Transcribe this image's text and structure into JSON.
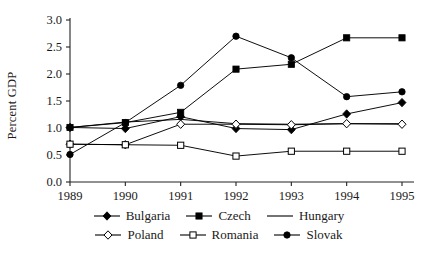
{
  "chart_data": {
    "type": "line",
    "title": "",
    "xlabel": "",
    "ylabel": "Percent GDP",
    "categories": [
      "1989",
      "1990",
      "1991",
      "1992",
      "1993",
      "1994",
      "1995"
    ],
    "x": [
      1989,
      1990,
      1991,
      1992,
      1993,
      1994,
      1995
    ],
    "ylim": [
      0.0,
      3.0
    ],
    "yticks": [
      "0.0",
      "0.5",
      "1.0",
      "1.5",
      "2.0",
      "2.5",
      "3.0"
    ],
    "ytick_values": [
      0.0,
      0.5,
      1.0,
      1.5,
      2.0,
      2.5,
      3.0
    ],
    "grid": false,
    "legend_position": "bottom",
    "series": [
      {
        "name": "Bulgaria",
        "marker": "filled-diamond",
        "values": [
          1.01,
          0.99,
          1.21,
          0.99,
          0.97,
          1.26,
          1.47
        ]
      },
      {
        "name": "Czech",
        "marker": "filled-square",
        "values": [
          1.01,
          1.1,
          1.29,
          2.09,
          2.18,
          2.67,
          2.67
        ]
      },
      {
        "name": "Hungary",
        "marker": "none",
        "values": [
          1.01,
          1.11,
          1.16,
          1.08,
          1.07,
          1.08,
          1.08
        ]
      },
      {
        "name": "Poland",
        "marker": "open-diamond",
        "values": [
          0.7,
          0.69,
          1.07,
          1.07,
          1.06,
          1.08,
          1.07
        ]
      },
      {
        "name": "Romania",
        "marker": "open-square",
        "values": [
          0.7,
          0.69,
          0.68,
          0.48,
          0.57,
          0.57,
          0.57
        ]
      },
      {
        "name": "Slovak",
        "marker": "filled-circle",
        "values": [
          0.51,
          1.1,
          1.79,
          2.7,
          2.3,
          1.58,
          1.67
        ]
      }
    ]
  },
  "axis": {
    "y_label": "Percent GDP",
    "y_ticks": [
      "3.0",
      "2.5",
      "2.0",
      "1.5",
      "1.0",
      "0.5",
      "0.0"
    ],
    "x_ticks": [
      "1989",
      "1990",
      "1991",
      "1992",
      "1993",
      "1994",
      "1995"
    ]
  },
  "legend": {
    "rows": [
      [
        {
          "label": "Bulgaria",
          "marker": "filled-diamond"
        },
        {
          "label": "Czech",
          "marker": "filled-square"
        },
        {
          "label": "Hungary",
          "marker": "none"
        }
      ],
      [
        {
          "label": "Poland",
          "marker": "open-diamond"
        },
        {
          "label": "Romania",
          "marker": "open-square"
        },
        {
          "label": "Slovak",
          "marker": "filled-circle"
        }
      ]
    ]
  },
  "colors": {
    "line": "#000000",
    "text": "#1a1a1a",
    "background": "#ffffff"
  }
}
